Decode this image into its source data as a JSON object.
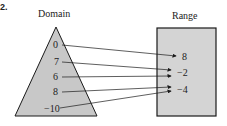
{
  "figure_label": "2.",
  "domain": {
    "title": "Domain",
    "values": [
      "0",
      "7",
      "6",
      "8",
      "−10"
    ]
  },
  "range": {
    "title": "Range",
    "values": [
      "8",
      "−2",
      "−4"
    ]
  },
  "mapping": [
    {
      "from": "0",
      "to": "8"
    },
    {
      "from": "7",
      "to": "−2"
    },
    {
      "from": "6",
      "to": "−2"
    },
    {
      "from": "8",
      "to": "−4"
    },
    {
      "from": "−10",
      "to": "−4"
    }
  ],
  "colors": {
    "fill": "#c8c8c8",
    "stroke": "#1a1a1a"
  }
}
